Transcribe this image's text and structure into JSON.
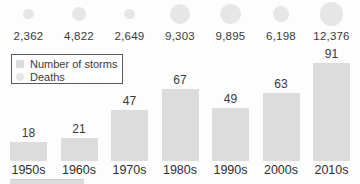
{
  "colors": {
    "bar_fill": "#dcdcdc",
    "bubble_fill": "#e6e6e6",
    "text": "#3a3a3a",
    "legend_border": "#5a5a5a",
    "background": "#fdfdfd"
  },
  "legend": {
    "position": "top-left",
    "items": [
      {
        "label": "Number of storms",
        "swatch": "square"
      },
      {
        "label": "Deaths",
        "swatch": "circle"
      }
    ]
  },
  "chart_data": {
    "type": "bar",
    "categories": [
      "1950s",
      "1960s",
      "1970s",
      "1980s",
      "1990s",
      "2000s",
      "2010s"
    ],
    "series": [
      {
        "name": "Number of storms",
        "type": "bar",
        "values": [
          18,
          21,
          47,
          67,
          49,
          63,
          91
        ],
        "labels": [
          "18",
          "21",
          "47",
          "67",
          "49",
          "63",
          "91"
        ]
      },
      {
        "name": "Deaths",
        "type": "bubble",
        "values": [
          2362,
          4822,
          2649,
          9303,
          9895,
          6198,
          12376
        ],
        "labels": [
          "2,362",
          "4,822",
          "2,649",
          "9,303",
          "9,895",
          "6,198",
          "12,376"
        ]
      }
    ],
    "title": "",
    "xlabel": "",
    "ylabel": "",
    "ylim": [
      0,
      100
    ],
    "grid": false,
    "legend_position": "top-left"
  }
}
